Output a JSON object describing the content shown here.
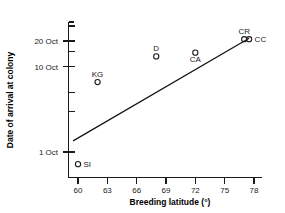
{
  "chart_data": {
    "type": "scatter",
    "title": "",
    "xlabel": "Breeding latitude (°)",
    "ylabel": "Date of arrival at colony",
    "xlim": [
      59,
      79
    ],
    "xticks": [
      60,
      63,
      66,
      69,
      72,
      75,
      78
    ],
    "xticklabels": [
      "60",
      "63",
      "66",
      "69",
      "72",
      "75",
      "78"
    ],
    "yscale": "log",
    "ylim_days": [
      0.55,
      30
    ],
    "yticks_major_days": [
      1,
      10,
      20
    ],
    "yticklabels": [
      "1 Oct",
      "10 Oct",
      "20 Oct"
    ],
    "yticks_minor_days": [
      3,
      5,
      15,
      30
    ],
    "grid": false,
    "legend": false,
    "points": [
      {
        "label": "SI",
        "x": 60.0,
        "y_days": 0.72,
        "label_pos": "right"
      },
      {
        "label": "KG",
        "x": 62.0,
        "y_days": 6.6,
        "label_pos": "above"
      },
      {
        "label": "D",
        "x": 68.0,
        "y_days": 13.2,
        "label_pos": "above"
      },
      {
        "label": "CA",
        "x": 72.0,
        "y_days": 14.6,
        "label_pos": "below"
      },
      {
        "label": "CR",
        "x": 77.0,
        "y_days": 21.0,
        "label_pos": "above"
      },
      {
        "label": "CC",
        "x": 77.5,
        "y_days": 21.0,
        "label_pos": "right"
      }
    ],
    "trend_line": {
      "x_start": 59.5,
      "y_start_days": 1.35,
      "x_end": 77.5,
      "y_end_days": 21.6
    }
  }
}
